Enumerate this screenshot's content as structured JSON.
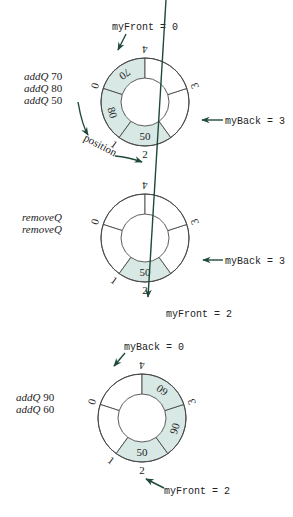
{
  "colors": {
    "filled": "#d8e8e4",
    "empty": "#ffffff",
    "stroke": "#4a4a4a",
    "arrow": "#1f4a3a"
  },
  "states": [
    {
      "operations": [
        {
          "op": "addQ",
          "value": "70"
        },
        {
          "op": "addQ",
          "value": "80"
        },
        {
          "op": "addQ",
          "value": "50"
        }
      ],
      "segments": [
        {
          "index": "0",
          "value": "70",
          "filled": true
        },
        {
          "index": "1",
          "value": "80",
          "filled": true
        },
        {
          "index": "2",
          "value": "50",
          "filled": true
        },
        {
          "index": "3",
          "value": "",
          "filled": false
        },
        {
          "index": "4",
          "value": "",
          "filled": false
        }
      ],
      "pointers": [
        {
          "label": "myFront = 0",
          "target": "0"
        },
        {
          "label": "myBack = 3",
          "target": "3"
        }
      ],
      "direction_label": "position"
    },
    {
      "operations": [
        {
          "op": "removeQ",
          "value": ""
        },
        {
          "op": "removeQ",
          "value": ""
        }
      ],
      "segments": [
        {
          "index": "0",
          "value": "",
          "filled": false
        },
        {
          "index": "1",
          "value": "",
          "filled": false
        },
        {
          "index": "2",
          "value": "50",
          "filled": true
        },
        {
          "index": "3",
          "value": "",
          "filled": false
        },
        {
          "index": "4",
          "value": "",
          "filled": false
        }
      ],
      "pointers": [
        {
          "label": "myBack = 3",
          "target": "3"
        },
        {
          "label": "myFront = 2",
          "target": "2"
        }
      ]
    },
    {
      "operations": [
        {
          "op": "addQ",
          "value": "90"
        },
        {
          "op": "addQ",
          "value": "60"
        }
      ],
      "segments": [
        {
          "index": "0",
          "value": "",
          "filled": false
        },
        {
          "index": "1",
          "value": "",
          "filled": false
        },
        {
          "index": "2",
          "value": "50",
          "filled": true
        },
        {
          "index": "3",
          "value": "90",
          "filled": true
        },
        {
          "index": "4",
          "value": "60",
          "filled": true
        }
      ],
      "pointers": [
        {
          "label": "myBack = 0",
          "target": "0"
        },
        {
          "label": "myFront = 2",
          "target": "2"
        }
      ]
    }
  ]
}
